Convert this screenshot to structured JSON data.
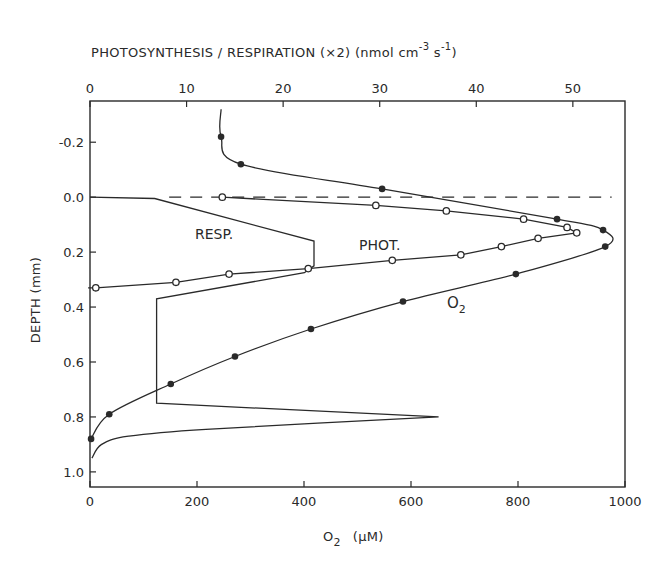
{
  "chart_data": {
    "type": "line",
    "title": "",
    "top_axis": {
      "label": "PHOTOSYNTHESIS / RESPIRATION (×2)  (nmol cm⁻³ s⁻¹)",
      "label_main": "PHOTOSYNTHESIS / RESPIRATION (×2)  (nmol cm",
      "label_exp1": "-3",
      "label_mid": " s",
      "label_exp2": "-1",
      "label_end": ")",
      "ticks": [
        0,
        10,
        20,
        30,
        40,
        50
      ],
      "range": [
        0,
        55.4
      ]
    },
    "bottom_axis": {
      "label": "O₂ (µM)",
      "label_main": "O",
      "label_sub": "2",
      "label_unit": "(µM)",
      "ticks": [
        0,
        200,
        400,
        600,
        800,
        1000
      ],
      "range": [
        0,
        1000
      ]
    },
    "y_axis": {
      "label": "DEPTH (mm)",
      "ticks": [
        -0.2,
        0.0,
        0.2,
        0.4,
        0.6,
        0.8,
        1.0
      ],
      "tick_labels": [
        "-0.2",
        "0.0",
        "0.2",
        "0.4",
        "0.6",
        "0.8",
        "1.0"
      ],
      "range": [
        -0.35,
        1.055
      ],
      "inverted": true
    },
    "surface_line": {
      "depth": 0.0,
      "style": "dashed",
      "x_start_um": 148,
      "x_end_um": 975
    },
    "series": [
      {
        "name": "O2",
        "label": "O",
        "label_sub": "2",
        "axis": "bottom",
        "marker": "filled-circle",
        "top_line": {
          "x": 245,
          "depth_from": -0.32,
          "depth_to": -0.22
        },
        "points": [
          {
            "x": 245,
            "depth": -0.22
          },
          {
            "x": 282,
            "depth": -0.12
          },
          {
            "x": 546,
            "depth": -0.03
          },
          {
            "x": 873,
            "depth": 0.08
          },
          {
            "x": 959,
            "depth": 0.12
          },
          {
            "x": 963,
            "depth": 0.18
          },
          {
            "x": 796,
            "depth": 0.28
          },
          {
            "x": 585,
            "depth": 0.38
          },
          {
            "x": 413,
            "depth": 0.48
          },
          {
            "x": 271,
            "depth": 0.58
          },
          {
            "x": 151,
            "depth": 0.68
          },
          {
            "x": 36,
            "depth": 0.79
          },
          {
            "x": 2,
            "depth": 0.88
          }
        ]
      },
      {
        "name": "PHOT.",
        "label": "PHOT.",
        "axis": "top",
        "marker": "open-circle",
        "points": [
          {
            "x": 13.7,
            "depth": 0.0
          },
          {
            "x": 29.6,
            "depth": 0.03
          },
          {
            "x": 36.9,
            "depth": 0.05
          },
          {
            "x": 44.9,
            "depth": 0.08
          },
          {
            "x": 49.4,
            "depth": 0.11
          },
          {
            "x": 50.4,
            "depth": 0.13
          },
          {
            "x": 46.4,
            "depth": 0.15
          },
          {
            "x": 42.6,
            "depth": 0.18
          },
          {
            "x": 38.4,
            "depth": 0.21
          },
          {
            "x": 31.3,
            "depth": 0.23
          },
          {
            "x": 22.6,
            "depth": 0.26
          },
          {
            "x": 14.4,
            "depth": 0.28
          },
          {
            "x": 8.9,
            "depth": 0.31
          },
          {
            "x": 0.6,
            "depth": 0.33
          }
        ],
        "line_end": {
          "x": -0.2,
          "depth": 0.33
        }
      },
      {
        "name": "RESP.",
        "label": "RESP.",
        "axis": "top",
        "marker": "none",
        "points": [
          {
            "x": 0.0,
            "depth": 0.0
          },
          {
            "x": 6.7,
            "depth": 0.005
          },
          {
            "x": 23.2,
            "depth": 0.16
          },
          {
            "x": 23.2,
            "depth": 0.25
          },
          {
            "x": 22.2,
            "depth": 0.275
          },
          {
            "x": 6.9,
            "depth": 0.37
          },
          {
            "x": 6.9,
            "depth": 0.75
          },
          {
            "x": 36.1,
            "depth": 0.8
          },
          {
            "x": 12.0,
            "depth": 0.845
          },
          {
            "x": 4.0,
            "depth": 0.87
          },
          {
            "x": 1.2,
            "depth": 0.9
          },
          {
            "x": 0.2,
            "depth": 0.95
          }
        ]
      }
    ],
    "annotations": [
      {
        "text": "RESP.",
        "x": 195,
        "y": 239
      },
      {
        "text": "PHOT.",
        "x": 359,
        "y": 250
      },
      {
        "text": "O2",
        "x": 447,
        "y": 309
      }
    ],
    "grid": false,
    "legend": "inline labels"
  }
}
